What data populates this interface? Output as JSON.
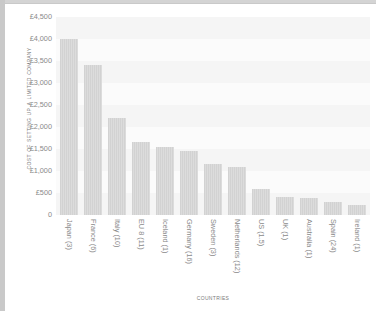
{
  "chart_data": {
    "type": "bar",
    "title": "",
    "xlabel": "Countries",
    "ylabel": "Cost of Setting up a Limited Company",
    "ylim": [
      0,
      4500
    ],
    "ytick_step": 500,
    "ytick_labels": [
      "£4,500",
      "£4,000",
      "£3,500",
      "£3,000",
      "£2,500",
      "£2,000",
      "£1,500",
      "£1,000",
      "£500",
      "0"
    ],
    "ytick_values": [
      4500,
      4000,
      3500,
      3000,
      2500,
      2000,
      1500,
      1000,
      500,
      0
    ],
    "currency_symbol": "£",
    "grid": "horizontal-bands",
    "legend": "none",
    "bar_color": "#d6d6d6",
    "categories": [
      "Japan (3)",
      "France (6)",
      "Italy (10)",
      "EU 8 (11)",
      "Iceland (1)",
      "Germany (16)",
      "Sweden (3)",
      "Netherlands (12)",
      "US (1.5)",
      "UK (1)",
      "Australia (1)",
      "Spain (24)",
      "Ireland (1)"
    ],
    "values": [
      4000,
      3400,
      2200,
      1650,
      1550,
      1450,
      1150,
      1100,
      600,
      400,
      380,
      300,
      220
    ]
  }
}
